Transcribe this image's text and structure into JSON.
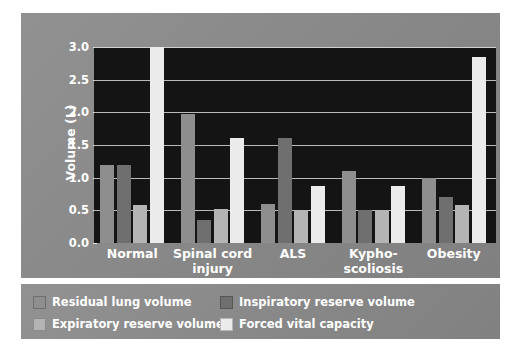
{
  "chart_data": {
    "type": "bar",
    "title": "",
    "subtitle": "",
    "xlabel": "",
    "ylabel": "Volume (L)",
    "ylim": [
      0.0,
      3.0
    ],
    "ytick_labels": [
      "0.0",
      "0.5",
      "1.0",
      "1.5",
      "2.0",
      "2.5",
      "3.0"
    ],
    "ytick_values": [
      0.0,
      0.5,
      1.0,
      1.5,
      2.0,
      2.5,
      3.0
    ],
    "grid": "horizontal",
    "legend_position": "below-plot",
    "categories": [
      "Normal",
      "Spinal cord injury",
      "ALS",
      "Kypho-scoliosis",
      "Obesity"
    ],
    "category_lines": [
      [
        "Normal",
        ""
      ],
      [
        "Spinal cord",
        "injury"
      ],
      [
        "ALS",
        ""
      ],
      [
        "Kypho-",
        "scoliosis"
      ],
      [
        "Obesity",
        ""
      ]
    ],
    "series": [
      {
        "name": "Residual lung volume",
        "color": "#8e8e8e",
        "values": [
          1.2,
          1.97,
          0.6,
          1.1,
          1.0
        ]
      },
      {
        "name": "Inspiratory reserve volume",
        "color": "#6f6f6f",
        "values": [
          1.2,
          0.35,
          1.6,
          0.5,
          0.7
        ]
      },
      {
        "name": "Expiratory reserve volume",
        "color": "#b4b4b4",
        "values": [
          0.58,
          0.52,
          0.5,
          0.5,
          0.58
        ]
      },
      {
        "name": "Forced vital capacity",
        "color": "#ebebeb",
        "values": [
          3.0,
          1.6,
          0.88,
          0.87,
          2.85
        ]
      }
    ],
    "plot_background": "#141414",
    "panel_background": "#8a8a8a",
    "gridline_color": "#b9b9b9",
    "text_color": "#ffffff"
  },
  "legend": {
    "items": [
      {
        "label": "Residual lung volume",
        "color": "#8e8e8e"
      },
      {
        "label": "Inspiratory reserve volume",
        "color": "#6f6f6f"
      },
      {
        "label": "Expiratory reserve volume",
        "color": "#b4b4b4"
      },
      {
        "label": "Forced vital capacity",
        "color": "#ebebeb"
      }
    ]
  }
}
